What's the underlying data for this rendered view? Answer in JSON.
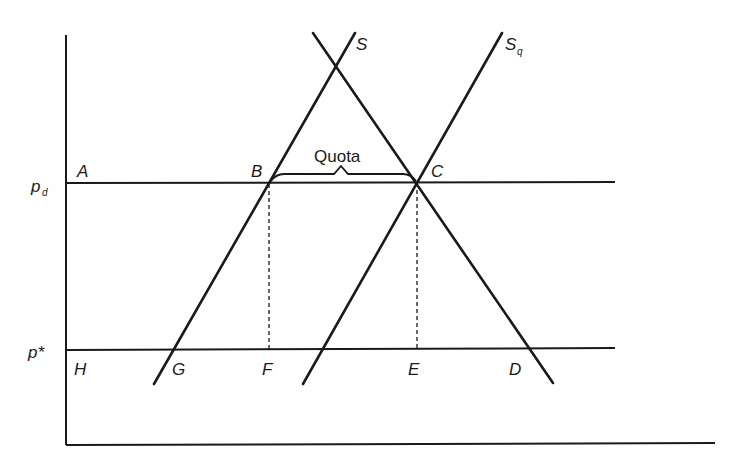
{
  "diagram": {
    "axes": {
      "y_labels": {
        "p_d": {
          "main": "p",
          "sub": "d"
        },
        "p_star": "p*"
      }
    },
    "curves": {
      "S": {
        "label": "S"
      },
      "Sq": {
        "label": "S",
        "sub": "q"
      },
      "D": {
        "label": ""
      }
    },
    "points": {
      "A": "A",
      "B": "B",
      "C": "C",
      "D": "D",
      "E": "E",
      "F": "F",
      "G": "G",
      "H": "H"
    },
    "annotation": {
      "quota": "Quota"
    },
    "colors": {
      "ink": "#1a1a1a",
      "background": "#ffffff"
    }
  }
}
